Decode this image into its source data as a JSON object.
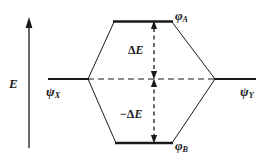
{
  "figure": {
    "type": "molecular-orbital-correlation-diagram",
    "background_color": "#ffffff",
    "line_color": "#1a1a1a"
  },
  "axis": {
    "label": "E",
    "name": "energy-axis",
    "direction": "up",
    "arrowhead": "top"
  },
  "levels": {
    "left": {
      "label_base": "ψ",
      "label_sub": "X",
      "name": "psi-x"
    },
    "right": {
      "label_base": "ψ",
      "label_sub": "Y",
      "name": "psi-y"
    },
    "top": {
      "label_base": "φ",
      "label_sub": "A",
      "name": "phi-a"
    },
    "bottom": {
      "label_base": "φ",
      "label_sub": "B",
      "name": "phi-b"
    }
  },
  "gaps": {
    "upper": {
      "prefix": "",
      "delta": "Δ",
      "symbol": "E",
      "full": "ΔE"
    },
    "lower": {
      "prefix": "−",
      "delta": "Δ",
      "symbol": "E",
      "full": "−ΔE"
    }
  }
}
